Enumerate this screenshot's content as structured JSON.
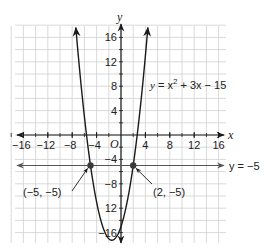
{
  "chart_data": {
    "type": "line",
    "title": "",
    "xlabel": "x",
    "ylabel": "y",
    "xlim": [
      -17,
      17
    ],
    "ylim": [
      -17.5,
      17.5
    ],
    "grid": true,
    "grid_step": 2,
    "x_ticks": [
      -16,
      -12,
      -8,
      -4,
      4,
      8,
      12,
      16
    ],
    "x_tick_labels": [
      "−16",
      "−12",
      "−8",
      "−4",
      "4",
      "8",
      "12",
      "16"
    ],
    "y_ticks": [
      16,
      12,
      8,
      4,
      -4,
      -8,
      -12,
      -16
    ],
    "y_tick_labels": [
      "16",
      "12",
      "8",
      "4",
      "−4",
      "−8",
      "12",
      "−16"
    ],
    "origin_label": "O",
    "series": [
      {
        "name": "y = x² + 3x − 15",
        "kind": "parabola",
        "equation": {
          "a": 1,
          "b": 3,
          "c": -15
        },
        "color": "#1a1a1a"
      },
      {
        "name": "y = −5",
        "kind": "horizontal_line",
        "y": -5,
        "color": "#555555"
      }
    ],
    "points": [
      {
        "x": -5,
        "y": -5,
        "label": "(−5, −5)"
      },
      {
        "x": 2,
        "y": -5,
        "label": "(2, −5)"
      }
    ]
  },
  "labels": {
    "x_axis": "x",
    "y_axis": "y",
    "origin": "O",
    "parabola_eq_y": "y",
    "parabola_eq_rest": " = x",
    "parabola_eq_sup": "2",
    "parabola_eq_tail": " + 3x − 15",
    "line_eq": "y = −5",
    "point_left": "(−5, −5)",
    "point_right": "(2, −5)"
  },
  "ticks": {
    "x": [
      {
        "label": "−16",
        "v": -16
      },
      {
        "label": "−12",
        "v": -12
      },
      {
        "label": "−8",
        "v": -8
      },
      {
        "label": "−4",
        "v": -4
      },
      {
        "label": "4",
        "v": 4
      },
      {
        "label": "8",
        "v": 8
      },
      {
        "label": "12",
        "v": 12
      },
      {
        "label": "16",
        "v": 16
      }
    ],
    "y": [
      {
        "label": "16",
        "v": 16
      },
      {
        "label": "12",
        "v": 12
      },
      {
        "label": "8",
        "v": 8
      },
      {
        "label": "4",
        "v": 4
      },
      {
        "label": "−4",
        "v": -4
      },
      {
        "label": "−8",
        "v": -8
      },
      {
        "label": "12",
        "v": -12
      },
      {
        "label": "−16",
        "v": -16
      }
    ]
  },
  "colors": {
    "grid": "#cfcfcf",
    "axis": "#1a1a1a",
    "curve": "#1a1a1a",
    "line": "#555555",
    "point": "#3a3a3a"
  }
}
